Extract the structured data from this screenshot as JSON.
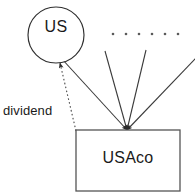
{
  "diagram": {
    "type": "entity-relationship-diagram",
    "background_color": "#ffffff",
    "stroke_color": "#3a3a3a",
    "text_color": "#1a1a1a",
    "nodes": [
      {
        "id": "us",
        "label": "US",
        "shape": "circle",
        "center_x": 56,
        "center_y": 35,
        "radius": 28
      },
      {
        "id": "usaco",
        "label": "USAco",
        "shape": "rectangle",
        "x": 76,
        "y": 130,
        "width": 104,
        "height": 61
      }
    ],
    "edges": [
      {
        "id": "dividend",
        "label": "dividend",
        "style": "dotted",
        "arrowhead": "start",
        "from_x": 76,
        "from_y": 131,
        "to_x": 59,
        "to_y": 62
      },
      {
        "id": "ownership-left",
        "label": "",
        "style": "solid",
        "arrowhead": "end",
        "from_x": 62,
        "from_y": 59,
        "to_x": 127,
        "to_y": 130
      },
      {
        "id": "ownership-mid-left",
        "label": "",
        "style": "solid",
        "arrowhead": "end",
        "from_x": 105,
        "from_y": 51,
        "to_x": 127,
        "to_y": 130
      },
      {
        "id": "ownership-mid-right",
        "label": "",
        "style": "solid",
        "arrowhead": "end",
        "from_x": 146,
        "from_y": 50,
        "to_x": 127,
        "to_y": 130
      },
      {
        "id": "ownership-right",
        "label": "",
        "style": "solid",
        "arrowhead": "end",
        "from_x": 195,
        "from_y": 59,
        "to_x": 127,
        "to_y": 130
      }
    ],
    "ellipsis": {
      "id": "shareholders-ellipsis",
      "dot_count": 6,
      "y": 34,
      "start_x": 113,
      "spacing": 13,
      "radius": 1.3
    }
  }
}
